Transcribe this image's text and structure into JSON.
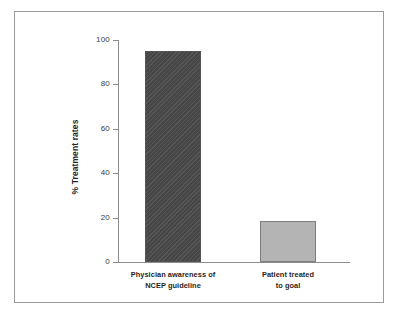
{
  "chart_data": {
    "type": "bar",
    "title": "",
    "subtitle": "",
    "xlabel": "",
    "ylabel": "% Treatment rates",
    "ylim": [
      0,
      100
    ],
    "yticks": [
      0,
      20,
      40,
      60,
      80,
      100
    ],
    "ytick_labels": [
      "0",
      "20",
      "40",
      "60",
      "80",
      "100"
    ],
    "grid": false,
    "legend": null,
    "categories": [
      "Physician awareness of NCEP guideline",
      "Patient treated to goal"
    ],
    "category_lines": [
      [
        "Physician awareness of",
        "NCEP guideline"
      ],
      [
        "Patient treated",
        "to goal"
      ]
    ],
    "values": [
      95,
      18.5
    ],
    "bar_colors": [
      "#4a4a4a",
      "#b4b4b4"
    ],
    "bar_edge_colors": [
      "#555555",
      "#7d7d7d"
    ],
    "bar_patterns": [
      "diagonal-hatch",
      "solid"
    ],
    "axis_color": "#8c8c8c",
    "frame_color": "#9a9a9a",
    "background_color": "#ffffff",
    "text_color": "#1f1f1f"
  }
}
